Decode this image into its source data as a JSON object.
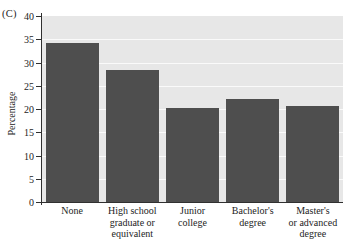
{
  "panel": {
    "label": "(C)"
  },
  "chart_data": {
    "type": "bar",
    "title": "",
    "xlabel": "",
    "ylabel": "Percentage",
    "categories": [
      "None",
      "High school graduate or equivalent",
      "Junior college",
      "Bachelor's degree",
      "Master's or advanced degree"
    ],
    "category_lines": [
      [
        "None"
      ],
      [
        "High school",
        "graduate or",
        "equivalent"
      ],
      [
        "Junior",
        "college"
      ],
      [
        "Bachelor's",
        "degree"
      ],
      [
        "Master's",
        "or advanced",
        "degree"
      ]
    ],
    "values": [
      34.3,
      28.4,
      20.2,
      22.2,
      20.6
    ],
    "ylim": [
      0,
      40
    ],
    "yticks": [
      0,
      5,
      10,
      15,
      20,
      25,
      30,
      35,
      40
    ],
    "ytick_labels": [
      "0",
      "5",
      "10",
      "15",
      "20",
      "25",
      "30",
      "35",
      "40"
    ],
    "grid": true,
    "legend": "none",
    "bar_color": "#4e4e4e",
    "plot_background": "#e7e7e7",
    "gridline_color": "#fbfbfb",
    "axis_color": "#303030"
  }
}
